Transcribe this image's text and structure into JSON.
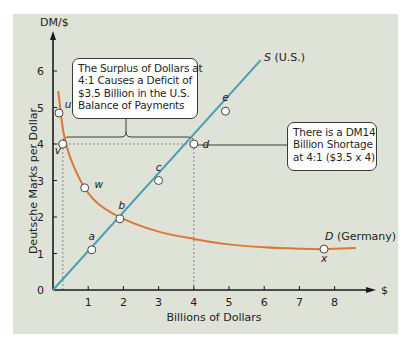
{
  "chart_data": {
    "type": "line",
    "title": "",
    "xlabel": "Billions of Dollars",
    "ylabel": "Deutsche Marks per Dollar",
    "x_axis_unit": "$",
    "y_axis_unit": "DM/$",
    "xlim": [
      0,
      8.8
    ],
    "ylim": [
      0,
      6.5
    ],
    "x_ticks": [
      1,
      2,
      3,
      4,
      5,
      6,
      7,
      8
    ],
    "y_ticks": [
      0,
      1,
      2,
      3,
      4,
      5,
      6
    ],
    "origin_label": "0",
    "grid": false,
    "series": [
      {
        "name": "S (U.S.)",
        "label_italic": "S",
        "label_rest": " (U.S.)",
        "color": "#4a9fb5",
        "kind": "supply",
        "x": [
          0,
          5.9
        ],
        "y": [
          0,
          6.3
        ]
      },
      {
        "name": "D (Germany)",
        "label_italic": "D",
        "label_rest": " (Germany)",
        "color": "#d9773a",
        "kind": "demand",
        "x": [
          0.15,
          0.3,
          0.5,
          0.9,
          1.3,
          2.0,
          3.0,
          4.0,
          5.0,
          6.0,
          7.0,
          7.7,
          8.6
        ],
        "y": [
          5.45,
          4.3,
          3.6,
          2.8,
          2.35,
          1.95,
          1.6,
          1.4,
          1.25,
          1.17,
          1.13,
          1.12,
          1.15
        ]
      }
    ],
    "points": [
      {
        "label": "a",
        "x": 1.1,
        "y": 1.1,
        "label_dx": 0,
        "label_dy": -10
      },
      {
        "label": "b",
        "x": 1.9,
        "y": 1.95,
        "label_dx": 2,
        "label_dy": -10
      },
      {
        "label": "c",
        "x": 3.0,
        "y": 3.0,
        "label_dx": 0,
        "label_dy": -10
      },
      {
        "label": "d",
        "x": 4.0,
        "y": 4.0,
        "label_dx": 12,
        "label_dy": 4
      },
      {
        "label": "e",
        "x": 4.9,
        "y": 4.9,
        "label_dx": 0,
        "label_dy": -10
      },
      {
        "label": "u",
        "x": 0.17,
        "y": 4.85,
        "label_dx": 9,
        "label_dy": -5
      },
      {
        "label": "v",
        "x": 0.28,
        "y": 4.0,
        "label_dx": -5,
        "label_dy": 10
      },
      {
        "label": "w",
        "x": 0.9,
        "y": 2.8,
        "label_dx": 14,
        "label_dy": 0
      },
      {
        "label": "x",
        "x": 7.7,
        "y": 1.12,
        "label_dx": 0,
        "label_dy": 13
      }
    ],
    "reference_lines": [
      {
        "type": "horizontal-dashed",
        "y": 4.0,
        "x_from": 0,
        "x_to": 4.0
      },
      {
        "type": "vertical-dashed",
        "x": 0.28,
        "y_from": 0,
        "y_to": 4.0
      },
      {
        "type": "vertical-dashed",
        "x": 4.0,
        "y_from": 0,
        "y_to": 4.0
      }
    ],
    "annotations": [
      {
        "id": "surplus",
        "lines": [
          "The Surplus of Dollars at",
          "4:1 Causes a Deficit of",
          "$3.5 Billion in the U.S.",
          "Balance of Payments"
        ],
        "bracket_from_x": 0.28,
        "bracket_to_x": 4.0,
        "at_y": 4.0
      },
      {
        "id": "shortage",
        "lines": [
          "There is a DM14",
          "Billion Shortage",
          "at 4:1 ($3.5 x 4)"
        ],
        "connects_to_point": "d"
      }
    ]
  },
  "colors": {
    "panel_bg": "#dfe2d6",
    "axis": "#1a1a1a",
    "supply": "#4a9fb5",
    "demand": "#d9773a",
    "dashed": "#8a8a8a",
    "callout_border": "#3a3a3a"
  }
}
